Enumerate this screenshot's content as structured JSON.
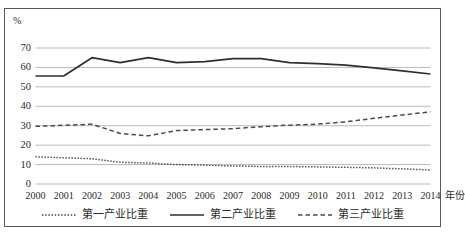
{
  "chart_data": {
    "type": "line",
    "title": "",
    "xlabel": "年份",
    "ylabel": "%",
    "ylim": [
      0,
      75
    ],
    "yticks": [
      0,
      10,
      20,
      30,
      40,
      50,
      60,
      70
    ],
    "grid": true,
    "legend_position": "bottom",
    "categories": [
      "2000",
      "2001",
      "2002",
      "2003",
      "2004",
      "2005",
      "2006",
      "2007",
      "2008",
      "2009",
      "2010",
      "2011",
      "2012",
      "2013",
      "2014"
    ],
    "series": [
      {
        "name": "第一产业比重",
        "style": "dotted",
        "color": "#3a3a3a",
        "values": [
          14.0,
          13.5,
          13.0,
          11.2,
          10.8,
          10.0,
          9.7,
          9.3,
          9.0,
          9.0,
          8.8,
          8.6,
          8.3,
          7.8,
          7.2
        ]
      },
      {
        "name": "第二产业比重",
        "style": "solid",
        "color": "#2f2f2f",
        "values": [
          55.6,
          55.6,
          65.0,
          62.5,
          65.0,
          62.5,
          63.0,
          64.5,
          64.5,
          62.5,
          62.0,
          61.2,
          59.8,
          58.2,
          56.6
        ]
      },
      {
        "name": "第三产业比重",
        "style": "dashed",
        "color": "#4a4a4a",
        "values": [
          29.7,
          30.2,
          30.8,
          26.0,
          24.8,
          27.5,
          28.0,
          28.5,
          29.5,
          30.3,
          30.8,
          32.0,
          33.8,
          35.5,
          37.2
        ]
      }
    ]
  },
  "axis": {
    "unit_label": "%",
    "x_title": "年份",
    "ytick_labels": [
      "70",
      "60",
      "50",
      "40",
      "30",
      "20",
      "10",
      "0"
    ]
  },
  "legend": {
    "items": [
      {
        "label": "第一产业比重",
        "style": "dotted"
      },
      {
        "label": "第二产业比重",
        "style": "solid"
      },
      {
        "label": "第三产业比重",
        "style": "dashed"
      }
    ]
  },
  "colors": {
    "frame": "#5a5a5a",
    "grid": "#b9b9b9",
    "axis_text": "#2b2b2b",
    "series_primary": "#3a3a3a",
    "series_secondary": "#2f2f2f",
    "series_tertiary": "#4a4a4a"
  }
}
